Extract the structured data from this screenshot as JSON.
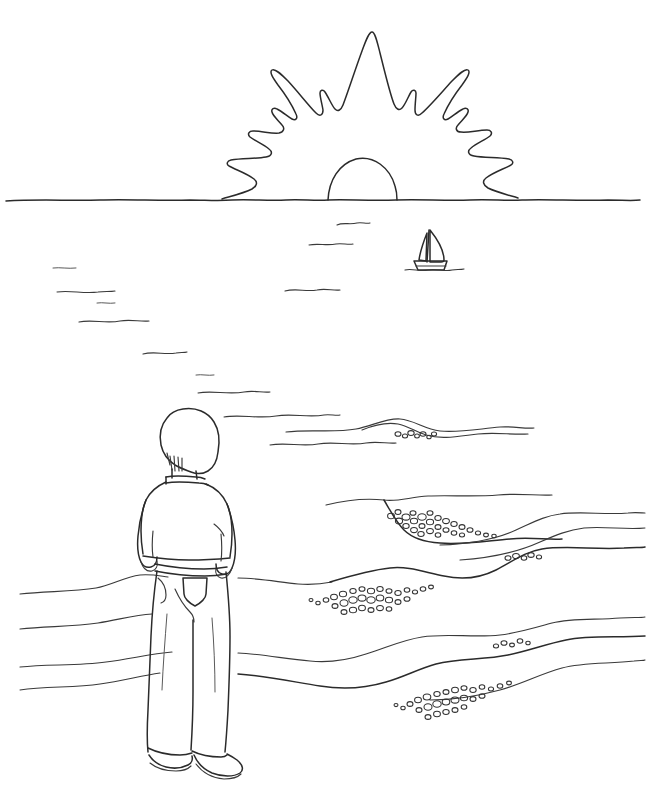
{
  "artwork": {
    "title": "Person Watching Sunset Over the Sea",
    "medium": "pen and ink line drawing",
    "style": "coloring-book outline, hand-drawn contour lines",
    "background_color": "#ffffff",
    "ink_color": "#2b2b2b",
    "faint_ink_color": "#5a5a5a",
    "canvas": {
      "width": 646,
      "height": 795
    }
  },
  "scene": {
    "setting": "ocean beach at sunrise or sunset",
    "horizon_y": 200,
    "elements": [
      "sun-with-jagged-rays",
      "horizon-line",
      "ocean-water-dashes",
      "sailboat",
      "standing-figure-back-view",
      "beach-shoreline-curves",
      "pebble-clusters"
    ]
  },
  "sun": {
    "label": "Sun",
    "description": "half-risen sun dome on the horizon surrounded by long jagged flame-like rays",
    "dome_center_x": 355,
    "dome_radius": 40,
    "ray_count": 9,
    "top_spike_y": 32,
    "span_x": [
      222,
      500
    ]
  },
  "sailboat": {
    "label": "Sailboat",
    "description": "small single-masted sailboat with triangular mainsail and jib on the water",
    "x": 420,
    "y": 250,
    "width": 40,
    "height": 42
  },
  "figure": {
    "label": "Standing person",
    "view": "from behind",
    "parts": [
      {
        "name": "head-and-hair",
        "label": "Head with short hair"
      },
      {
        "name": "neck-and-collar",
        "label": "Neck and collar"
      },
      {
        "name": "torso-sweater",
        "label": "Long sleeve top"
      },
      {
        "name": "left-arm",
        "label": "Left arm"
      },
      {
        "name": "right-arm",
        "label": "Right arm"
      },
      {
        "name": "jeans-waistband",
        "label": "Jeans waistband"
      },
      {
        "name": "back-pocket",
        "label": "Jeans back pocket"
      },
      {
        "name": "trouser-legs",
        "label": "Wide leg trousers"
      },
      {
        "name": "left-shoe",
        "label": "Left shoe"
      },
      {
        "name": "right-shoe",
        "label": "Right shoe"
      }
    ],
    "bounds": {
      "x": 128,
      "y": 408,
      "width": 110,
      "height": 370
    }
  },
  "water": {
    "label": "Ocean surface",
    "dash_count": 12,
    "description": "short horizontal wavy dashes suggesting light glinting on the water"
  },
  "shore": {
    "label": "Shoreline and beach",
    "curve_count": 9,
    "pebble_cluster_count": 5,
    "description": "sweeping sand contour lines with clusters of small rounded pebbles gathered along the wet edges"
  },
  "palette": {
    "paper": "#ffffff",
    "ink_dark": "#2b2b2b",
    "ink_mid": "#3a3a3a",
    "ink_light": "#5a5a5a"
  }
}
